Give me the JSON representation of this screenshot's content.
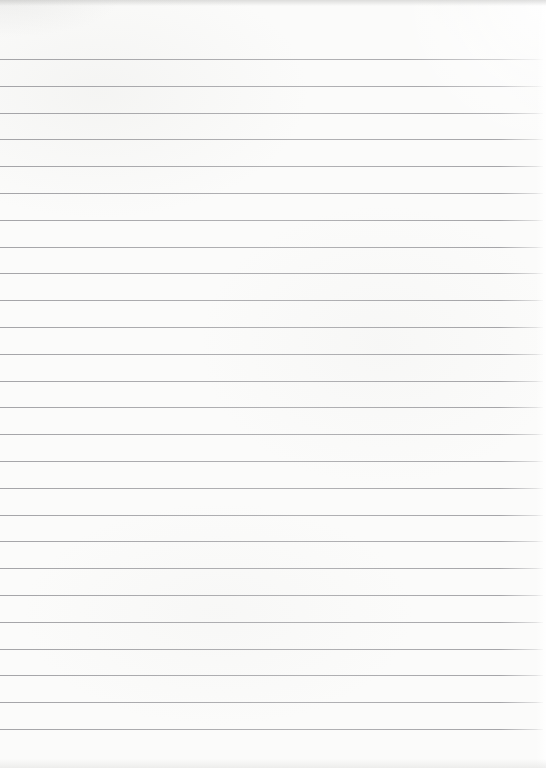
{
  "paper": {
    "background_color": "#fbfbfa",
    "edge_shadow_color": "#969694",
    "content": "",
    "notes_text": ""
  },
  "ruling": {
    "line_count": 26,
    "first_line_y": 59,
    "line_spacing": 26.8,
    "line_thickness_px": 1,
    "line_color": "#96969a",
    "left_inset_px": 0,
    "right_inset_px": 3
  }
}
